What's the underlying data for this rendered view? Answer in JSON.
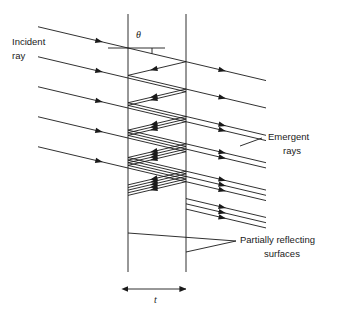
{
  "figure": {
    "title_text": "",
    "background_color": "#ffffff",
    "stroke_color": "#1a1a1a",
    "line_width": 0.9
  },
  "labels": {
    "incident_ray_line1": "Incident",
    "incident_ray_line2": "ray",
    "emergent_line1": "Emergent",
    "emergent_line2": "rays",
    "partially_line1": "Partially reflecting",
    "partially_line2": "surfaces",
    "angle_symbol": "θ",
    "thickness_symbol": "t"
  },
  "geometry": {
    "surface_left_x": 128,
    "surface_right_x": 186,
    "surface_top_y": 14,
    "surface_bottom_y": 272,
    "thickness_dim_y": 289,
    "ray_slope": 0.236,
    "incident_ray_hit_ys": [
      48,
      78,
      108,
      138,
      168
    ],
    "incident_ray_start_x": 38,
    "emergent_ray_end_x": 266,
    "normal_line_y": 48,
    "normal_line_x2": 165,
    "angle_tick_x": 152,
    "leader_join_x": 236,
    "leader_join_y": 241,
    "leader_left_y": 233,
    "leader_right_y": 252,
    "emergent_leader_x1": 240,
    "emergent_leader_x2": 262,
    "emergent_leader_y1": 146,
    "emergent_leader_y2": 138
  },
  "text_positions": {
    "incident_x": 12,
    "incident_y": 45,
    "emergent_x": 268,
    "emergent_y": 140,
    "partially_x": 240,
    "partially_y": 243,
    "theta_x": 136,
    "theta_y": 38,
    "t_x": 154,
    "t_y": 303
  }
}
